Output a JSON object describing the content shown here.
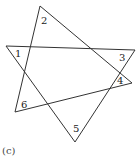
{
  "figure": {
    "caption": "(c)",
    "angle_labels": [
      {
        "id": "1",
        "text": "1",
        "x": 15,
        "y": 57
      },
      {
        "id": "2",
        "text": "2",
        "x": 41,
        "y": 24
      },
      {
        "id": "3",
        "text": "3",
        "x": 119,
        "y": 61
      },
      {
        "id": "4",
        "text": "4",
        "x": 117,
        "y": 84
      },
      {
        "id": "5",
        "text": "5",
        "x": 73,
        "y": 132
      },
      {
        "id": "6",
        "text": "6",
        "x": 21,
        "y": 108
      }
    ],
    "line_color": "#333333"
  }
}
